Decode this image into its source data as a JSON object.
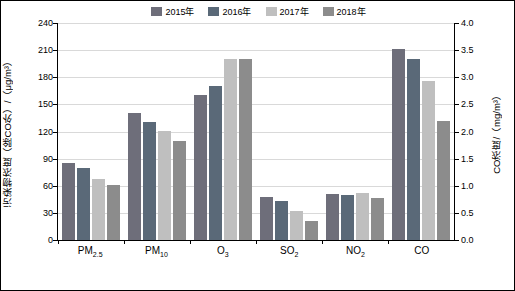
{
  "chart_data": {
    "type": "bar",
    "title": "",
    "categories": [
      "PM2.5",
      "PM10",
      "O3",
      "SO2",
      "NO2",
      "CO"
    ],
    "category_labels_html": [
      "PM",
      "PM",
      "O",
      "SO",
      "NO",
      "CO"
    ],
    "series": [
      {
        "name": "2015年",
        "color": "#6E6E7A",
        "values": [
          85,
          141,
          160,
          48,
          51,
          211
        ]
      },
      {
        "name": "2016年",
        "color": "#5A6978",
        "values": [
          80,
          131,
          170,
          43,
          50,
          200
        ]
      },
      {
        "name": "2017年",
        "color": "#BFBFBF",
        "values": [
          68,
          121,
          200,
          32,
          52,
          176
        ]
      },
      {
        "name": "2018年",
        "color": "#8C8C8C",
        "values": [
          61,
          110,
          200,
          21,
          47,
          132
        ]
      }
    ],
    "left_axis": {
      "label": "污染物浓度（除CO外）/（μg/m³）",
      "ticks": [
        "0",
        "30",
        "60",
        "90",
        "120",
        "150",
        "180",
        "210",
        "240"
      ],
      "min": 0,
      "max": 240
    },
    "right_axis": {
      "label": "CO浓度/（mg/m³）",
      "ticks": [
        "0.0",
        "0.5",
        "1.0",
        "1.5",
        "2.0",
        "2.5",
        "3.0",
        "3.5",
        "4.0"
      ],
      "min": 0,
      "max": 4.0
    },
    "legend_position": "top-center",
    "grid": true
  },
  "legend": [
    {
      "label": "2015年",
      "color": "#6E6E7A"
    },
    {
      "label": "2016年",
      "color": "#5A6978"
    },
    {
      "label": "2017年",
      "color": "#BFBFBF"
    },
    {
      "label": "2018年",
      "color": "#8C8C8C"
    }
  ],
  "axis": {
    "left_title": "污染物浓度（除CO外）/（μg/m³）",
    "right_title": "CO浓度/（mg/m³）",
    "left_ticks": [
      "240",
      "210",
      "180",
      "150",
      "120",
      "90",
      "60",
      "30",
      "0"
    ],
    "right_ticks": [
      "4.0",
      "3.5",
      "3.0",
      "2.5",
      "2.0",
      "1.5",
      "1.0",
      "0.5",
      "0.0"
    ]
  },
  "categories": [
    {
      "base": "PM",
      "sub": "2.5"
    },
    {
      "base": "PM",
      "sub": "10"
    },
    {
      "base": "O",
      "sub": "3"
    },
    {
      "base": "SO",
      "sub": "2"
    },
    {
      "base": "NO",
      "sub": "2"
    },
    {
      "base": "CO",
      "sub": ""
    }
  ]
}
